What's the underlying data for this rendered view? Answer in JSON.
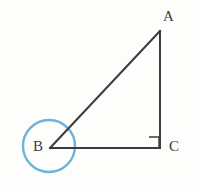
{
  "figure": {
    "type": "geometry-diagram",
    "background_color": "#fdfdfb",
    "stroke_color": "#3c3c3c",
    "highlight_color": "#6cb4de",
    "labels": {
      "a": "A",
      "b": "B",
      "c": "C"
    },
    "vertices": {
      "A": {
        "x": 160,
        "y": 31
      },
      "B": {
        "x": 50,
        "y": 148
      },
      "C": {
        "x": 160,
        "y": 148
      }
    },
    "segments": [
      {
        "name": "hypotenuse-ab",
        "from": "B",
        "to": "A"
      },
      {
        "name": "leg-ac",
        "from": "A",
        "to": "C"
      },
      {
        "name": "leg-bc",
        "from": "B",
        "to": "C"
      }
    ],
    "right_angle_marker": {
      "at_vertex": "C",
      "size": 10,
      "symbol": "square"
    },
    "highlight_circle": {
      "at_vertex": "B",
      "center_x": 49,
      "center_y": 146,
      "radius": 26,
      "stroke_width": 2.4
    }
  }
}
